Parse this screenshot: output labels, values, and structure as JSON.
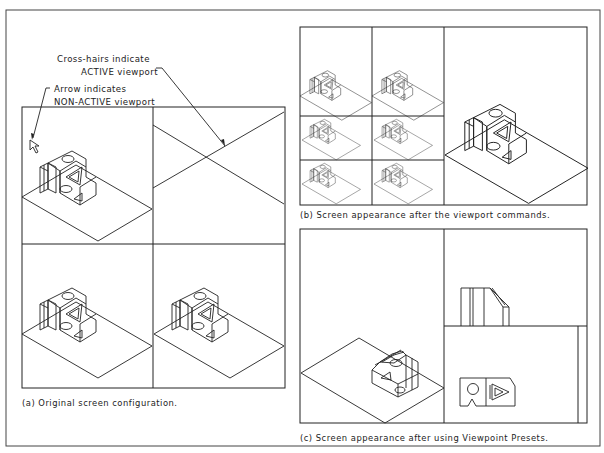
{
  "figure": {
    "background": "#ffffff",
    "line_color": "#222222",
    "panel_a": {
      "caption": "(a) Original screen configuration.",
      "annotations": {
        "crosshairs_line1": "Cross-hairs indicate",
        "crosshairs_line2": "ACTIVE viewport",
        "arrow_line1": "Arrow indicates",
        "arrow_line2": "NON-ACTIVE viewport"
      },
      "viewports": [
        {
          "name": "top-left",
          "content": "isometric-part",
          "cursor": "arrow-pointer"
        },
        {
          "name": "top-right",
          "content": "crosshairs",
          "active": true
        },
        {
          "name": "bottom-left",
          "content": "isometric-part"
        },
        {
          "name": "bottom-right",
          "content": "isometric-part"
        }
      ]
    },
    "panel_b": {
      "caption": "(b) Screen appearance after the viewport commands.",
      "viewports": [
        {
          "name": "left-col-top",
          "content": "isometric-part"
        },
        {
          "name": "mid-col-top",
          "content": "isometric-part"
        },
        {
          "name": "left-col-middle",
          "content": "isometric-part-small"
        },
        {
          "name": "mid-col-middle",
          "content": "isometric-part-small"
        },
        {
          "name": "left-col-bottom",
          "content": "isometric-part-small"
        },
        {
          "name": "mid-col-bottom",
          "content": "isometric-part-small"
        },
        {
          "name": "right-large",
          "content": "isometric-part-large"
        }
      ]
    },
    "panel_c": {
      "caption": "(c) Screen appearance after using Viewpoint Presets.",
      "viewports": [
        {
          "name": "left",
          "content": "isometric-part-rotated"
        },
        {
          "name": "top-right",
          "content": "front-view"
        },
        {
          "name": "bottom-right",
          "content": "top-view"
        }
      ]
    }
  }
}
